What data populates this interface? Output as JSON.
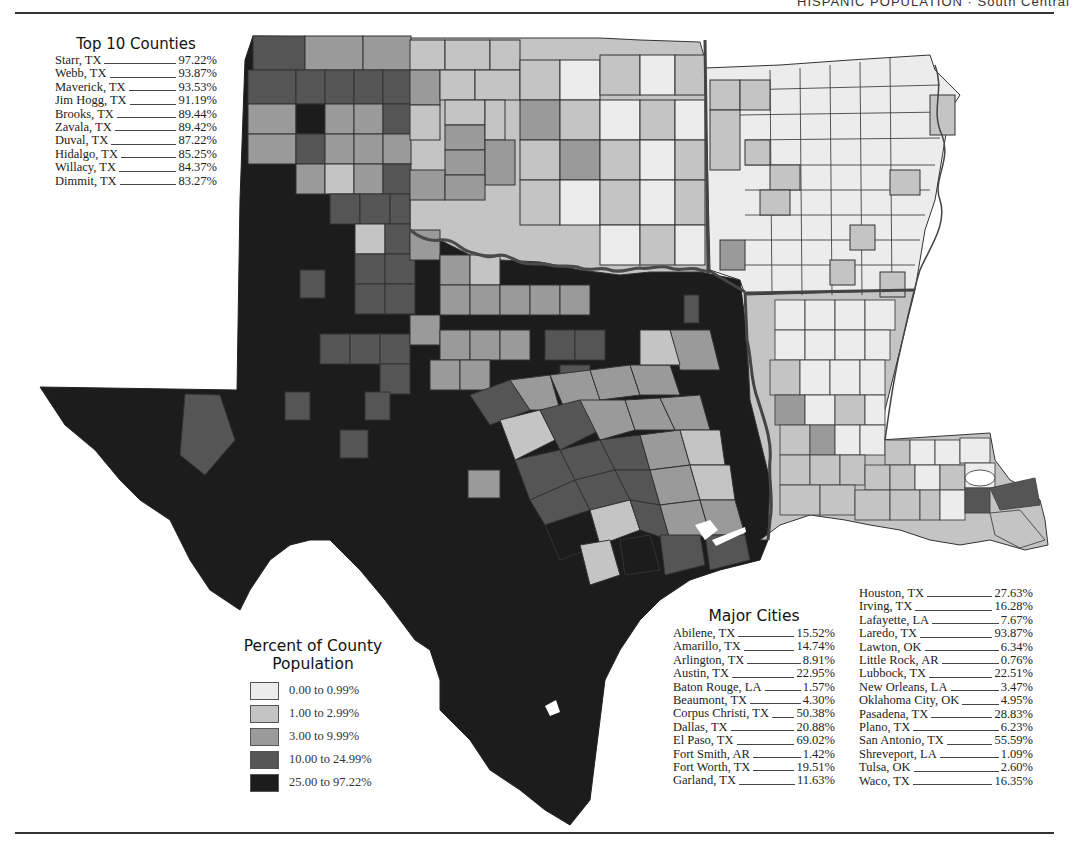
{
  "header": {
    "title": "HISPANIC POPULATION · South Central"
  },
  "top_counties": {
    "title": "Top 10 Counties",
    "items": [
      {
        "name": "Starr, TX",
        "value": "97.22%"
      },
      {
        "name": "Webb, TX",
        "value": "93.87%"
      },
      {
        "name": "Maverick, TX",
        "value": "93.53%"
      },
      {
        "name": "Jim Hogg, TX",
        "value": "91.19%"
      },
      {
        "name": "Brooks, TX",
        "value": "89.44%"
      },
      {
        "name": "Zavala, TX",
        "value": "89.42%"
      },
      {
        "name": "Duval, TX",
        "value": "87.22%"
      },
      {
        "name": "Hidalgo, TX",
        "value": "85.25%"
      },
      {
        "name": "Willacy, TX",
        "value": "84.37%"
      },
      {
        "name": "Dimmit, TX",
        "value": "83.27%"
      }
    ]
  },
  "legend": {
    "title_line1": "Percent of County",
    "title_line2": "Population",
    "items": [
      {
        "label": "0.00 to 0.99%",
        "color": "#ececec"
      },
      {
        "label": "1.00 to 2.99%",
        "color": "#c4c4c4"
      },
      {
        "label": "3.00 to 9.99%",
        "color": "#9a9a9a"
      },
      {
        "label": "10.00 to 24.99%",
        "color": "#555555"
      },
      {
        "label": "25.00 to 97.22%",
        "color": "#1c1c1c"
      }
    ]
  },
  "major_cities": {
    "title": "Major Cities",
    "column1": [
      {
        "name": "Abilene, TX",
        "value": "15.52%"
      },
      {
        "name": "Amarillo, TX",
        "value": "14.74%"
      },
      {
        "name": "Arlington, TX",
        "value": "8.91%"
      },
      {
        "name": "Austin, TX",
        "value": "22.95%"
      },
      {
        "name": "Baton Rouge, LA",
        "value": "1.57%"
      },
      {
        "name": "Beaumont, TX",
        "value": "4.30%"
      },
      {
        "name": "Corpus Christi, TX",
        "value": "50.38%"
      },
      {
        "name": "Dallas, TX",
        "value": "20.88%"
      },
      {
        "name": "El Paso, TX",
        "value": "69.02%"
      },
      {
        "name": "Fort Smith, AR",
        "value": "1.42%"
      },
      {
        "name": "Fort Worth, TX",
        "value": "19.51%"
      },
      {
        "name": "Garland, TX",
        "value": "11.63%"
      }
    ],
    "column2": [
      {
        "name": "Houston, TX",
        "value": "27.63%"
      },
      {
        "name": "Irving, TX",
        "value": "16.28%"
      },
      {
        "name": "Lafayette, LA",
        "value": "7.67%"
      },
      {
        "name": "Laredo, TX",
        "value": "93.87%"
      },
      {
        "name": "Lawton, OK",
        "value": "6.34%"
      },
      {
        "name": "Little Rock, AR",
        "value": "0.76%"
      },
      {
        "name": "Lubbock, TX",
        "value": "22.51%"
      },
      {
        "name": "New Orleans, LA",
        "value": "3.47%"
      },
      {
        "name": "Oklahoma City, OK",
        "value": "4.95%"
      },
      {
        "name": "Pasadena, TX",
        "value": "28.83%"
      },
      {
        "name": "Plano, TX",
        "value": "6.23%"
      },
      {
        "name": "San Antonio, TX",
        "value": "55.59%"
      },
      {
        "name": "Shreveport, LA",
        "value": "1.09%"
      },
      {
        "name": "Tulsa, OK",
        "value": "2.60%"
      },
      {
        "name": "Waco, TX",
        "value": "16.35%"
      }
    ]
  },
  "map": {
    "regions": [
      "Texas",
      "Oklahoma",
      "Arkansas",
      "Louisiana"
    ],
    "colors": {
      "c0": "#ececec",
      "c1": "#c4c4c4",
      "c2": "#9a9a9a",
      "c3": "#555555",
      "c4": "#1c1c1c",
      "border": "#333333",
      "state_border": "#444444"
    }
  }
}
